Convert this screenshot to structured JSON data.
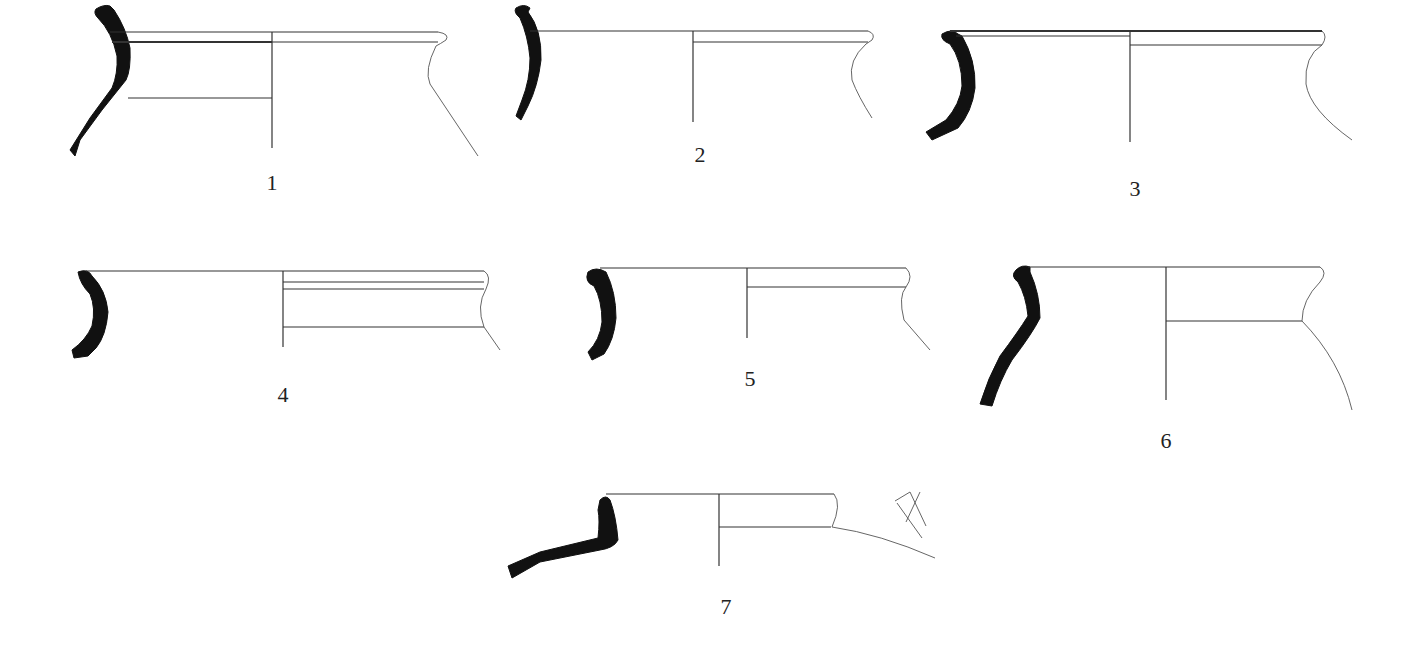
{
  "plate": {
    "title": "Pottery rim profiles",
    "colors": {
      "section_fill": "#111111",
      "line": "#333333",
      "background": "#ffffff"
    },
    "figures": [
      {
        "id": "1",
        "label": "1",
        "label_pos": [
          272,
          183
        ]
      },
      {
        "id": "2",
        "label": "2",
        "label_pos": [
          700,
          152
        ]
      },
      {
        "id": "3",
        "label": "3",
        "label_pos": [
          1135,
          186
        ]
      },
      {
        "id": "4",
        "label": "4",
        "label_pos": [
          283,
          392
        ]
      },
      {
        "id": "5",
        "label": "5",
        "label_pos": [
          750,
          376
        ]
      },
      {
        "id": "6",
        "label": "6",
        "label_pos": [
          1166,
          440
        ]
      },
      {
        "id": "7",
        "label": "7",
        "label_pos": [
          726,
          606
        ]
      }
    ]
  }
}
